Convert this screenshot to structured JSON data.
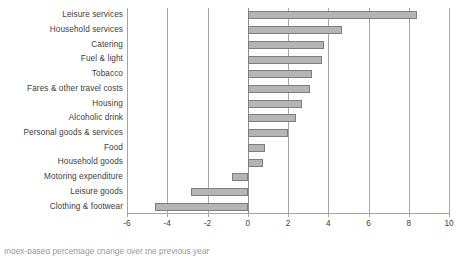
{
  "chart_data": {
    "type": "bar",
    "orientation": "horizontal",
    "title": "",
    "xlabel": "",
    "ylabel": "",
    "xlim": [
      -6,
      10
    ],
    "xticks": [
      -6,
      -4,
      -2,
      0,
      2,
      4,
      6,
      8,
      10
    ],
    "xtick_labels": [
      "-6",
      "-4",
      "-2",
      "0",
      "2",
      "4",
      "6",
      "8",
      "10"
    ],
    "grid": true,
    "legend": "none",
    "bar_color": "#b5b5b5",
    "bar_border_color": "#7e7e7e",
    "axis_color": "#a6a6a6",
    "categories": [
      "Leisure services",
      "Household services",
      "Catering",
      "Fuel & light",
      "Tobacco",
      "Fares & other travel costs",
      "Housing",
      "Alcoholic drink",
      "Personal goods & services",
      "Food",
      "Household goods",
      "Motoring expenditure",
      "Leisure goods",
      "Clothing & footwear"
    ],
    "values": [
      8.4,
      4.7,
      3.8,
      3.7,
      3.2,
      3.1,
      2.7,
      2.4,
      2.0,
      0.85,
      0.75,
      -0.8,
      -2.8,
      -4.6
    ]
  },
  "caption": {
    "partial_text": "Index-based percentage change over the previous year"
  }
}
